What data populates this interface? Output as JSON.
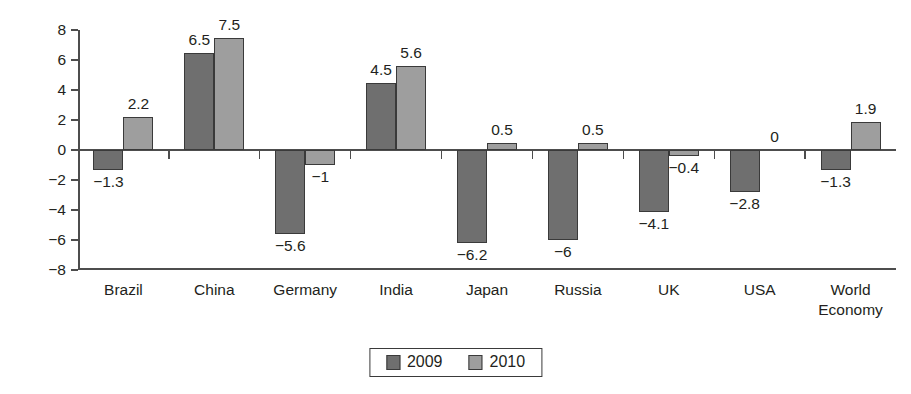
{
  "chart_data": {
    "type": "bar",
    "title": "",
    "subtitle": "",
    "xlabel": "",
    "ylabel": "",
    "ylim": [
      -8,
      8
    ],
    "y_ticks": [
      "8",
      "6",
      "4",
      "2",
      "0",
      "−2",
      "−4",
      "−6",
      "−8"
    ],
    "y_tick_values": [
      8,
      6,
      4,
      2,
      0,
      -2,
      -4,
      -6,
      -8
    ],
    "grid": false,
    "legend_position": "bottom-center",
    "categories": [
      "Brazil",
      "China",
      "Germany",
      "India",
      "Japan",
      "Russia",
      "UK",
      "USA",
      "World\nEconomy"
    ],
    "series": [
      {
        "name": "2009",
        "color": "#6f6f6f",
        "values": [
          -1.3,
          6.5,
          -5.6,
          4.5,
          -6.2,
          -6,
          -4.1,
          -2.8,
          -1.3
        ],
        "labels": [
          "−1.3",
          "6.5",
          "−5.6",
          "4.5",
          "−6.2",
          "−6",
          "−4.1",
          "−2.8",
          "−1.3"
        ]
      },
      {
        "name": "2010",
        "color": "#9e9e9e",
        "values": [
          2.2,
          7.5,
          -1,
          5.6,
          0.5,
          0.5,
          -0.4,
          0,
          1.9
        ],
        "labels": [
          "2.2",
          "7.5",
          "−1",
          "5.6",
          "0.5",
          "0.5",
          "−0.4",
          "0",
          "1.9"
        ]
      }
    ]
  },
  "legend": {
    "items": [
      {
        "label": "2009",
        "color": "#6f6f6f"
      },
      {
        "label": "2010",
        "color": "#9e9e9e"
      }
    ]
  },
  "colors": {
    "series_2009": "#6f6f6f",
    "series_2010": "#9e9e9e",
    "axis": "#4d4d4d",
    "text": "#231f20",
    "background": "#ffffff"
  }
}
